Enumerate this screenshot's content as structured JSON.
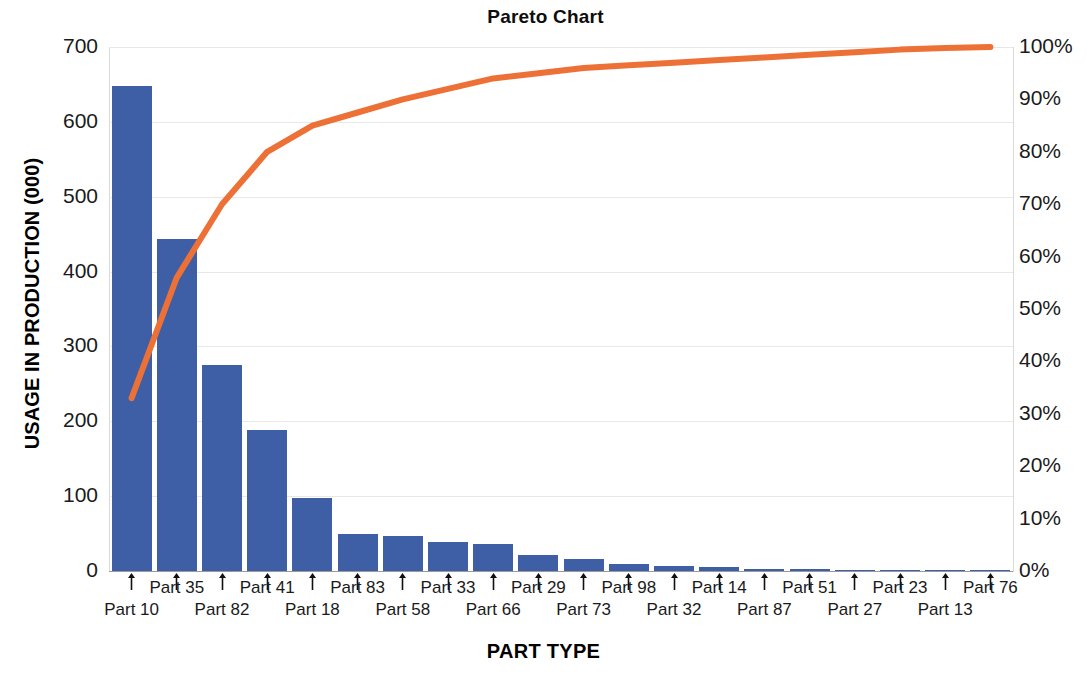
{
  "chart_data": {
    "type": "bar",
    "title": "Pareto Chart",
    "xlabel": "PART TYPE",
    "ylabel": "USAGE IN PRODUCTION (000)",
    "y2label": "",
    "categories": [
      "Part 10",
      "Part 35",
      "Part 82",
      "Part 41",
      "Part 18",
      "Part 83",
      "Part 58",
      "Part 33",
      "Part 66",
      "Part 29",
      "Part 73",
      "Part 98",
      "Part 32",
      "Part 14",
      "Part 87",
      "Part 51",
      "Part 27",
      "Part 23",
      "Part 13",
      "Part 76"
    ],
    "series": [
      {
        "name": "Usage in Production (000)",
        "kind": "bar",
        "color": "#3E5FA5",
        "values": [
          648,
          443,
          275,
          189,
          98,
          50,
          47,
          39,
          36,
          21,
          16,
          9,
          7,
          5,
          3,
          2.5,
          2,
          1.5,
          1,
          0.5
        ]
      },
      {
        "name": "Cumulative Percentage",
        "kind": "line",
        "color": "#ED7136",
        "axis": "right",
        "values": [
          33,
          56,
          70,
          80,
          85,
          87.5,
          90,
          92,
          94,
          95,
          96,
          96.5,
          97,
          97.5,
          98,
          98.5,
          99,
          99.5,
          99.8,
          100
        ]
      }
    ],
    "ylim": [
      0,
      700
    ],
    "ytick_values": [
      0,
      100,
      200,
      300,
      400,
      500,
      600,
      700
    ],
    "ytick_labels": [
      "0",
      "100",
      "200",
      "300",
      "400",
      "500",
      "600",
      "700"
    ],
    "y2lim": [
      0,
      100
    ],
    "y2tick_values": [
      0,
      10,
      20,
      30,
      40,
      50,
      60,
      70,
      80,
      90,
      100
    ],
    "y2tick_labels": [
      "0%",
      "10%",
      "20%",
      "30%",
      "40%",
      "50%",
      "60%",
      "70%",
      "80%",
      "90%",
      "100%"
    ],
    "grid": true,
    "grid_axis": "y",
    "legend": "none",
    "background": "#ffffff"
  }
}
